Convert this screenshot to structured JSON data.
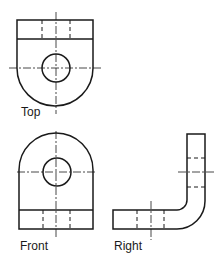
{
  "views": {
    "top": {
      "label": "Top"
    },
    "front": {
      "label": "Front"
    },
    "right": {
      "label": "Right"
    }
  },
  "colors": {
    "line": "#1a1a1a",
    "background": "#ffffff"
  }
}
